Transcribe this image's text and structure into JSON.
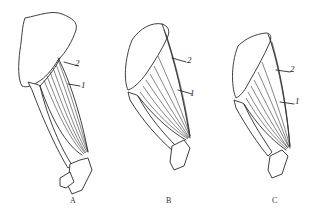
{
  "figure": {
    "panels": [
      {
        "id": "A",
        "caption": "A",
        "labels": [
          "2",
          "1"
        ]
      },
      {
        "id": "B",
        "caption": "B",
        "labels": [
          "2",
          "1"
        ]
      },
      {
        "id": "C",
        "caption": "C",
        "labels": [
          "2",
          "1"
        ]
      }
    ]
  }
}
